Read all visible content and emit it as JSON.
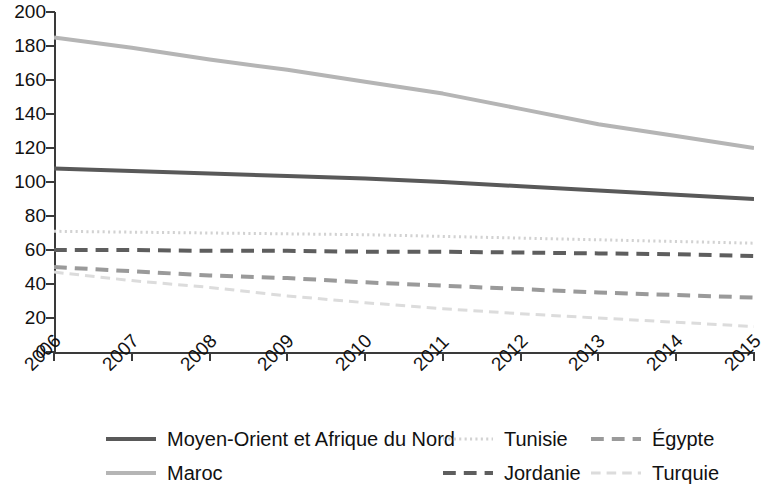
{
  "chart_data": {
    "type": "line",
    "title": "",
    "subtitle": "",
    "xlabel": "",
    "ylabel": "",
    "grid": false,
    "legend_position": "bottom",
    "x": [
      2006,
      2007,
      2008,
      2009,
      2010,
      2011,
      2012,
      2013,
      2014,
      2015
    ],
    "xtick_labels": [
      "2006",
      "2007",
      "2008",
      "2009",
      "2010",
      "2011",
      "2012",
      "2013",
      "2014",
      "2015"
    ],
    "ytick_labels": [
      "0",
      "20",
      "40",
      "60",
      "80",
      "100",
      "120",
      "140",
      "160",
      "180",
      "200"
    ],
    "yticks": [
      0,
      20,
      40,
      60,
      80,
      100,
      120,
      140,
      160,
      180,
      200
    ],
    "ylim": [
      0,
      200
    ],
    "xlim": [
      2006,
      2015
    ],
    "series": [
      {
        "name": "Moyen-Orient et Afrique du Nord",
        "color": "#595959",
        "style": "solid",
        "width": 4,
        "values": [
          108,
          106.5,
          105,
          103.5,
          102,
          100,
          97.5,
          95,
          92.5,
          90
        ]
      },
      {
        "name": "Maroc",
        "color": "#b5b5b5",
        "style": "solid",
        "width": 4,
        "values": [
          185,
          179,
          172,
          166,
          159,
          152,
          143,
          134,
          127,
          120
        ]
      },
      {
        "name": "Tunisie",
        "color": "#d2d2d2",
        "style": "dotted",
        "width": 3,
        "values": [
          71,
          70.5,
          70,
          69.5,
          69,
          68,
          67,
          66,
          65,
          64
        ]
      },
      {
        "name": "Jordanie",
        "color": "#5e5e5e",
        "style": "dashed",
        "width": 4,
        "values": [
          60,
          60,
          59.5,
          59.5,
          59,
          59,
          58.5,
          58,
          57.5,
          56.5
        ]
      },
      {
        "name": "Égypte",
        "color": "#9a9a9a",
        "style": "dashed",
        "width": 4,
        "values": [
          50,
          47.5,
          45,
          43.5,
          41,
          39,
          37,
          35,
          33.5,
          32
        ]
      },
      {
        "name": "Turquie",
        "color": "#dcdcdc",
        "style": "dashed",
        "width": 3,
        "values": [
          47,
          42,
          38,
          33,
          29,
          25.5,
          22.5,
          20,
          17.5,
          15
        ]
      }
    ]
  },
  "legend": {
    "rows": [
      [
        {
          "label": "Moyen-Orient et Afrique du Nord",
          "series": 0
        },
        {
          "label": "Tunisie",
          "series": 2
        },
        {
          "label": "Égypte",
          "series": 4
        }
      ],
      [
        {
          "label": "Maroc",
          "series": 1
        },
        {
          "label": "Jordanie",
          "series": 3
        },
        {
          "label": "Turquie",
          "series": 5
        }
      ]
    ]
  }
}
